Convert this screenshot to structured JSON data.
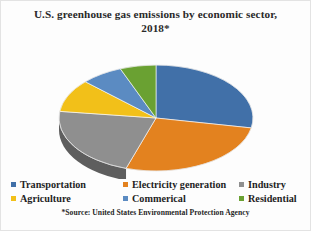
{
  "chart_data": {
    "type": "pie",
    "title": "U.S. greenhouse gas emissions by economic sector, 2018*",
    "title_line_1": "U.S. greenhouse gas emissions by economic sector,",
    "title_line_2": "2018*",
    "source_note": "*Source: United States Environmental Protection Agency",
    "legend_position": "bottom",
    "three_d": true,
    "categories": [
      "Transportation",
      "Electricity generation",
      "Industry",
      "Agriculture",
      "Commerical",
      "Residential"
    ],
    "values": [
      28,
      27,
      22,
      10,
      7,
      6
    ],
    "colors": [
      "#4170a8",
      "#e3821f",
      "#8f8f8f",
      "#f2c019",
      "#5b8bc2",
      "#6aa132"
    ],
    "slices": [
      {
        "label": "Transportation",
        "value": 28,
        "color": "#4170a8",
        "side_color": "#2f5party"
      },
      {
        "label": "Electricity generation",
        "value": 27,
        "color": "#e3821f",
        "side_color": "#a75a14"
      },
      {
        "label": "Industry",
        "value": 22,
        "color": "#8f8f8f",
        "side_color": "#5e5e5e"
      },
      {
        "label": "Agriculture",
        "value": 10,
        "color": "#f2c019",
        "side_color": "#b58d0d"
      },
      {
        "label": "Commerical",
        "value": 7,
        "color": "#5b8bc2",
        "side_color": "#3f6792"
      },
      {
        "label": "Residential",
        "value": 6,
        "color": "#6aa132",
        "side_color": "#4a7322"
      }
    ]
  },
  "legend": {
    "rows": [
      [
        {
          "label": "Transportation",
          "color": "#4170a8"
        },
        {
          "label": "Electricity generation",
          "color": "#e3821f"
        },
        {
          "label": "Industry",
          "color": "#8f8f8f"
        }
      ],
      [
        {
          "label": "Agriculture",
          "color": "#f2c019"
        },
        {
          "label": "Commerical",
          "color": "#5b8bc2"
        },
        {
          "label": "Residential",
          "color": "#6aa132"
        }
      ]
    ]
  }
}
